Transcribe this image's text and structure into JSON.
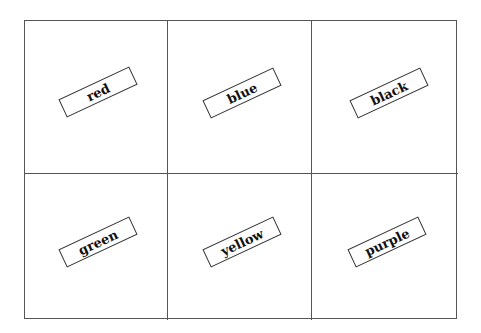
{
  "cards": [
    {
      "word": "red"
    },
    {
      "word": "blue"
    },
    {
      "word": "black"
    },
    {
      "word": "green"
    },
    {
      "word": "yellow"
    },
    {
      "word": "purple"
    }
  ]
}
